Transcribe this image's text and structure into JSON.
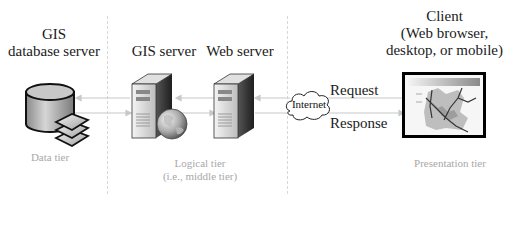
{
  "diagram": {
    "nodes": [
      {
        "id": "gis-db",
        "label_lines": [
          "GIS",
          "database server"
        ],
        "icon": "database-icon"
      },
      {
        "id": "gis-server",
        "label": "GIS server",
        "icon": "server-globe-icon"
      },
      {
        "id": "web-server",
        "label": "Web server",
        "icon": "server-icon"
      },
      {
        "id": "internet",
        "label": "Internet",
        "icon": "cloud-icon"
      },
      {
        "id": "client",
        "label_lines": [
          "Client",
          "(Web browser,",
          "desktop, or mobile)"
        ],
        "icon": "map-screen-icon"
      }
    ],
    "edges": [
      {
        "from": "web-server",
        "to": "client",
        "label": "Request",
        "direction": "client-to-server"
      },
      {
        "from": "web-server",
        "to": "client",
        "label": "Response",
        "direction": "server-to-client"
      }
    ],
    "tiers": [
      {
        "label_lines": [
          "Data tier"
        ]
      },
      {
        "label_lines": [
          "Logical tier",
          "(i.e., middle tier)"
        ]
      },
      {
        "label_lines": [
          "Presentation tier"
        ]
      }
    ]
  },
  "labels": {
    "gis_db_line1": "GIS",
    "gis_db_line2": "database server",
    "gis_server": "GIS server",
    "web_server": "Web server",
    "internet": "Internet",
    "request": "Request",
    "response": "Response",
    "client_line1": "Client",
    "client_line2": "(Web browser,",
    "client_line3": "desktop, or mobile)",
    "tier_data": "Data tier",
    "tier_logical_line1": "Logical tier",
    "tier_logical_line2": "(i.e., middle tier)",
    "tier_presentation": "Presentation tier"
  },
  "colors": {
    "text": "#1a1a1a",
    "tier_text": "#a8a8a8",
    "divider": "#d8d8d8",
    "arrow": "#c8c8c8"
  }
}
